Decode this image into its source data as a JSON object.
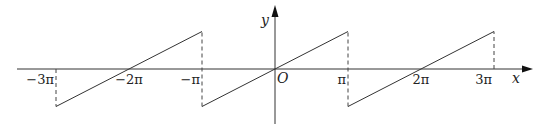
{
  "diagram": {
    "axes": {
      "x_label": "x",
      "y_label": "y",
      "origin_label": "O"
    },
    "x_ticks": [
      {
        "value": -3,
        "label": "−3π"
      },
      {
        "value": -2,
        "label": "−2π"
      },
      {
        "value": -1,
        "label": "−π"
      },
      {
        "value": 1,
        "label": "π"
      },
      {
        "value": 2,
        "label": "2π"
      },
      {
        "value": 3,
        "label": "3π"
      }
    ],
    "x_unit": "π",
    "segments": [
      {
        "from": [
          -3,
          -1
        ],
        "to": [
          -1,
          1
        ]
      },
      {
        "from": [
          -1,
          -1
        ],
        "to": [
          1,
          1
        ]
      },
      {
        "from": [
          1,
          -1
        ],
        "to": [
          3,
          1
        ]
      }
    ],
    "dashed_verticals": [
      {
        "x": -3,
        "from_y": 0,
        "to_y": -1
      },
      {
        "x": -1,
        "from_y": -1,
        "to_y": 1
      },
      {
        "x": 1,
        "from_y": -1,
        "to_y": 1
      },
      {
        "x": 3,
        "from_y": 0,
        "to_y": 1
      }
    ],
    "y_amplitude": "π",
    "colors": {
      "line": "#333333",
      "background": "#ffffff"
    }
  }
}
